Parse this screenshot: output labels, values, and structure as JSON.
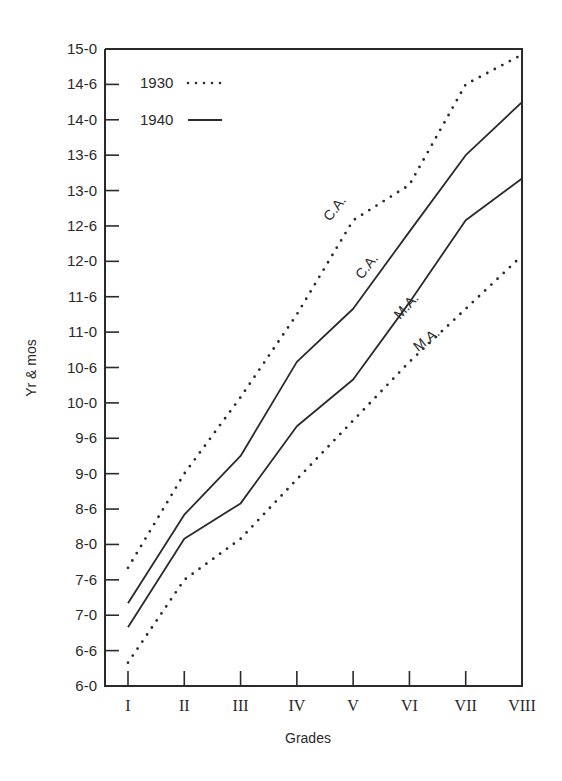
{
  "chart_data": {
    "type": "line",
    "title": "",
    "xlabel": "Grades",
    "ylabel": "Yr & mos",
    "categories": [
      "I",
      "II",
      "III",
      "IV",
      "V",
      "VI",
      "VII",
      "VIII"
    ],
    "y_ticks": [
      "6-0",
      "6-6",
      "7-0",
      "7-6",
      "8-0",
      "8-6",
      "9-0",
      "9-6",
      "10-0",
      "10-6",
      "11-0",
      "11-6",
      "12-0",
      "12-6",
      "13-0",
      "13-6",
      "14-0",
      "14-6",
      "15-0"
    ],
    "ylim": [
      6.0,
      15.0
    ],
    "y_units": "years (decimal); tick labels in years-months",
    "grid": false,
    "legend": {
      "position": "top-left inside",
      "entries": [
        {
          "label": "1930",
          "style": "dotted"
        },
        {
          "label": "1940",
          "style": "solid"
        }
      ]
    },
    "series": [
      {
        "name": "1930 C.A.",
        "year": "1930",
        "measure": "C.A.",
        "style": "dotted",
        "values": [
          7.67,
          9.0,
          10.08,
          11.25,
          12.58,
          13.08,
          14.5,
          14.92
        ],
        "labels_ym": [
          "7-8",
          "9-0",
          "10-1",
          "11-3",
          "12-7",
          "13-1",
          "14-6",
          "14-11"
        ]
      },
      {
        "name": "1940 C.A.",
        "year": "1940",
        "measure": "C.A.",
        "style": "solid",
        "values": [
          7.17,
          8.42,
          9.25,
          10.58,
          11.33,
          12.42,
          13.5,
          14.25
        ],
        "labels_ym": [
          "7-2",
          "8-5",
          "9-3",
          "10-7",
          "11-4",
          "12-5",
          "13-6",
          "14-3"
        ]
      },
      {
        "name": "1940 M.A.",
        "year": "1940",
        "measure": "M.A.",
        "style": "solid",
        "values": [
          6.83,
          8.08,
          8.58,
          9.67,
          10.33,
          11.42,
          12.58,
          13.17
        ],
        "labels_ym": [
          "6-10",
          "8-1",
          "8-7",
          "9-8",
          "10-4",
          "11-5",
          "12-7",
          "13-2"
        ]
      },
      {
        "name": "1930 M.A.",
        "year": "1930",
        "measure": "M.A.",
        "style": "dotted",
        "values": [
          6.33,
          7.5,
          8.08,
          8.92,
          9.75,
          10.58,
          11.33,
          12.08
        ],
        "labels_ym": [
          "6-4",
          "7-6",
          "8-1",
          "8-11",
          "9-9",
          "10-7",
          "11-4",
          "12-1"
        ]
      }
    ],
    "annotations": [
      {
        "text": "C.A.",
        "series": "1930 C.A.",
        "near": "between IV and V"
      },
      {
        "text": "C.A.",
        "series": "1940 C.A.",
        "near": "between V and VI"
      },
      {
        "text": "M.A.",
        "series": "1940 M.A.",
        "near": "between V and VI"
      },
      {
        "text": "M.A.",
        "series": "1930 M.A.",
        "near": "between VI and VII"
      }
    ]
  },
  "colors": {
    "ink": "#2a2a2a",
    "background": "#ffffff"
  }
}
